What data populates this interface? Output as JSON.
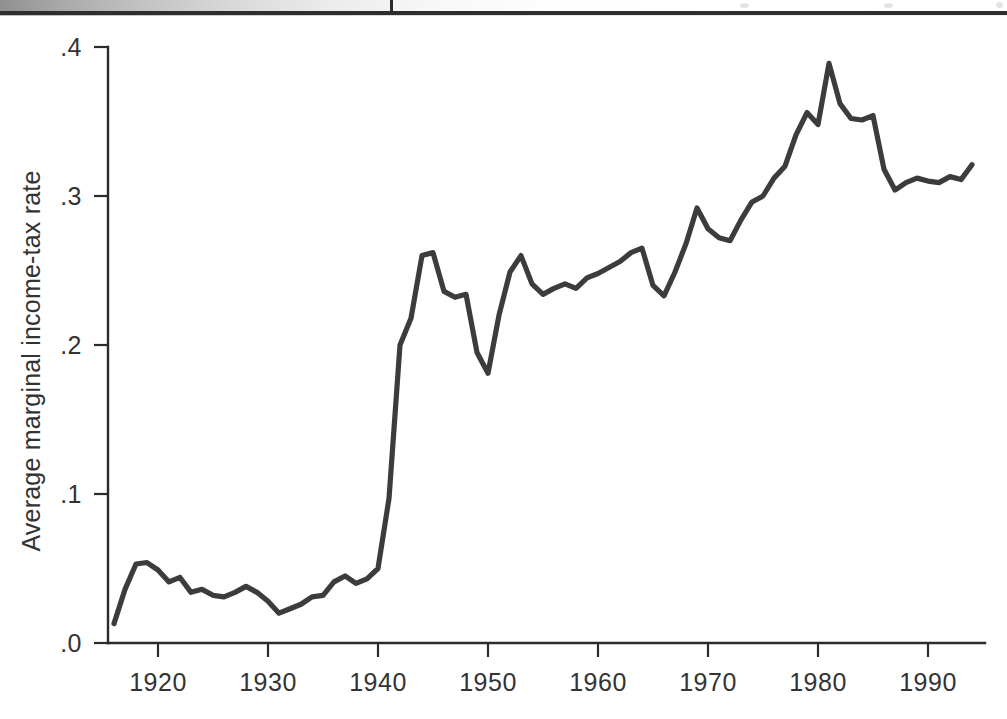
{
  "page": {
    "background_color": "#ffffff",
    "scan_artifact": {
      "name": "page-edge-band",
      "rule_color": "#2e2e2e"
    }
  },
  "chart_data": {
    "type": "line",
    "title": "",
    "subtitle": "",
    "xlabel": "",
    "ylabel": "Average marginal income-tax rate",
    "xlim": [
      1916,
      1994
    ],
    "ylim": [
      0.0,
      0.4
    ],
    "grid": false,
    "legend": null,
    "line_color": "#3c3c3c",
    "axis_color": "#2b2b2b",
    "xticks": [
      1920,
      1930,
      1940,
      1950,
      1960,
      1970,
      1980,
      1990
    ],
    "xticklabels": [
      "1920",
      "1930",
      "1940",
      "1950",
      "1960",
      "1970",
      "1980",
      "1990"
    ],
    "yticks": [
      0.0,
      0.1,
      0.2,
      0.3,
      0.4
    ],
    "yticklabels": [
      ".0",
      ".1",
      ".2",
      ".3",
      ".4"
    ],
    "x": [
      1916,
      1917,
      1918,
      1919,
      1920,
      1921,
      1922,
      1923,
      1924,
      1925,
      1926,
      1927,
      1928,
      1929,
      1930,
      1931,
      1932,
      1933,
      1934,
      1935,
      1936,
      1937,
      1938,
      1939,
      1940,
      1941,
      1942,
      1943,
      1944,
      1945,
      1946,
      1947,
      1948,
      1949,
      1950,
      1951,
      1952,
      1953,
      1954,
      1955,
      1956,
      1957,
      1958,
      1959,
      1960,
      1961,
      1962,
      1963,
      1964,
      1965,
      1966,
      1967,
      1968,
      1969,
      1970,
      1971,
      1972,
      1973,
      1974,
      1975,
      1976,
      1977,
      1978,
      1979,
      1980,
      1981,
      1982,
      1983,
      1984,
      1985,
      1986,
      1987,
      1988,
      1989,
      1990,
      1991,
      1992,
      1993,
      1994
    ],
    "values": [
      0.013,
      0.036,
      0.053,
      0.054,
      0.049,
      0.041,
      0.044,
      0.034,
      0.036,
      0.032,
      0.031,
      0.034,
      0.038,
      0.034,
      0.028,
      0.02,
      0.023,
      0.026,
      0.031,
      0.032,
      0.041,
      0.045,
      0.04,
      0.043,
      0.05,
      0.097,
      0.2,
      0.218,
      0.26,
      0.262,
      0.236,
      0.232,
      0.234,
      0.195,
      0.181,
      0.22,
      0.249,
      0.26,
      0.241,
      0.234,
      0.238,
      0.241,
      0.238,
      0.245,
      0.248,
      0.252,
      0.256,
      0.262,
      0.265,
      0.24,
      0.233,
      0.249,
      0.268,
      0.292,
      0.278,
      0.272,
      0.27,
      0.284,
      0.296,
      0.3,
      0.312,
      0.32,
      0.341,
      0.356,
      0.348,
      0.389,
      0.362,
      0.352,
      0.351,
      0.354,
      0.318,
      0.304,
      0.309,
      0.312,
      0.31,
      0.309,
      0.313,
      0.311,
      0.321
    ],
    "series": [
      {
        "name": "Average marginal income-tax rate",
        "color": "#3c3c3c",
        "style": "solid"
      }
    ],
    "annotations": []
  }
}
